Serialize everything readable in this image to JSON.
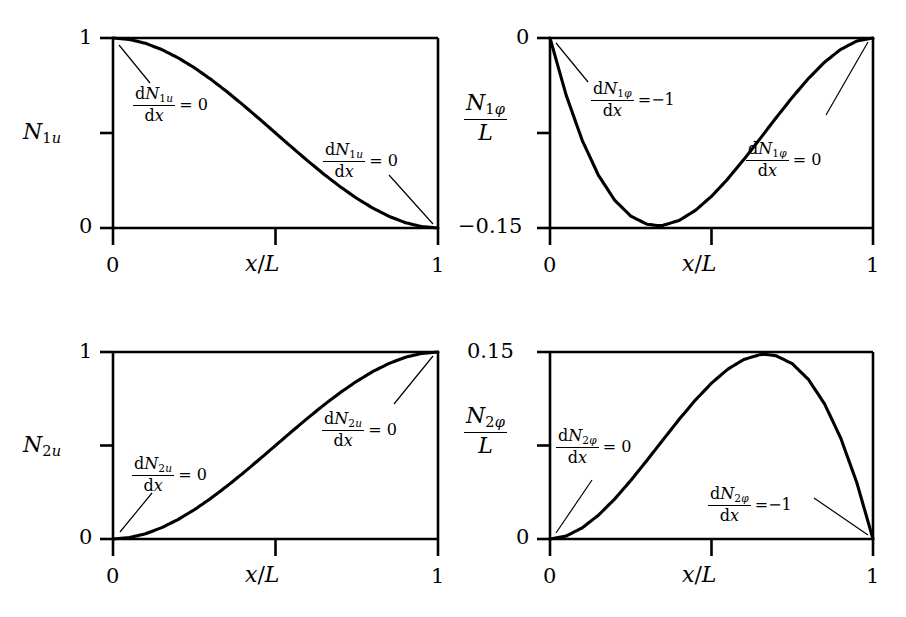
{
  "figure": {
    "background": "#ffffff",
    "ink": "#000000",
    "width": 906,
    "height": 617
  },
  "chart_data": [
    {
      "id": "N1u",
      "type": "line",
      "title": "",
      "ylabel": "N_1u",
      "xlabel": "x/L",
      "xlim": [
        0,
        1
      ],
      "ylim": [
        0,
        1
      ],
      "xticks": [
        0,
        0.5,
        1
      ],
      "xticklabels": [
        "0",
        "",
        "1"
      ],
      "yticks": [
        0,
        0.5,
        1
      ],
      "yticklabels": [
        "0",
        "",
        "1"
      ],
      "grid": false,
      "legend": false,
      "expression": "1 - 3t^2 + 2t^3",
      "x": [
        0,
        0.05,
        0.1,
        0.15,
        0.2,
        0.25,
        0.3,
        0.35,
        0.4,
        0.45,
        0.5,
        0.55,
        0.6,
        0.65,
        0.7,
        0.75,
        0.8,
        0.85,
        0.9,
        0.95,
        1
      ],
      "y": [
        1,
        0.9928,
        0.972,
        0.9393,
        0.896,
        0.8438,
        0.784,
        0.7183,
        0.648,
        0.5748,
        0.5,
        0.4253,
        0.352,
        0.2818,
        0.216,
        0.1563,
        0.104,
        0.0608,
        0.028,
        0.0073,
        0
      ],
      "annotations": [
        {
          "id": "left",
          "numerator": "dN_1u",
          "denominator": "dx",
          "equals": "= 0",
          "target_point": [
            0,
            1
          ]
        },
        {
          "id": "right",
          "numerator": "dN_1u",
          "denominator": "dx",
          "equals": "= 0",
          "target_point": [
            1,
            0
          ]
        }
      ]
    },
    {
      "id": "N1phi",
      "type": "line",
      "title": "",
      "ylabel": "N_1phi / L",
      "xlabel": "x/L",
      "xlim": [
        0,
        1
      ],
      "ylim": [
        -0.15,
        0
      ],
      "xticks": [
        0,
        0.5,
        1
      ],
      "xticklabels": [
        "0",
        "",
        "1"
      ],
      "yticks": [
        -0.15,
        -0.075,
        0
      ],
      "yticklabels": [
        "-0.15",
        "",
        "0"
      ],
      "grid": false,
      "legend": false,
      "expression": "-t(1-t)^2",
      "x": [
        0,
        0.05,
        0.1,
        0.15,
        0.2,
        0.25,
        0.3,
        0.3333,
        0.35,
        0.4,
        0.45,
        0.5,
        0.55,
        0.6,
        0.65,
        0.7,
        0.75,
        0.8,
        0.85,
        0.9,
        0.95,
        1
      ],
      "y": [
        0,
        -0.0451,
        -0.081,
        -0.1084,
        -0.128,
        -0.1406,
        -0.147,
        -0.1481,
        -0.1479,
        -0.144,
        -0.1361,
        -0.125,
        -0.1114,
        -0.096,
        -0.0796,
        -0.063,
        -0.0469,
        -0.032,
        -0.0191,
        -0.009,
        -0.0024,
        0
      ],
      "annotations": [
        {
          "id": "left",
          "numerator": "dN_1phi",
          "denominator": "dx",
          "equals": "= -1",
          "target_point": [
            0,
            0
          ]
        },
        {
          "id": "right",
          "numerator": "dN_1phi",
          "denominator": "dx",
          "equals": "= 0",
          "target_point": [
            1,
            0
          ]
        }
      ]
    },
    {
      "id": "N2u",
      "type": "line",
      "title": "",
      "ylabel": "N_2u",
      "xlabel": "x/L",
      "xlim": [
        0,
        1
      ],
      "ylim": [
        0,
        1
      ],
      "xticks": [
        0,
        0.5,
        1
      ],
      "xticklabels": [
        "0",
        "",
        "1"
      ],
      "yticks": [
        0,
        0.5,
        1
      ],
      "yticklabels": [
        "0",
        "",
        "1"
      ],
      "grid": false,
      "legend": false,
      "expression": "3t^2 - 2t^3",
      "x": [
        0,
        0.05,
        0.1,
        0.15,
        0.2,
        0.25,
        0.3,
        0.35,
        0.4,
        0.45,
        0.5,
        0.55,
        0.6,
        0.65,
        0.7,
        0.75,
        0.8,
        0.85,
        0.9,
        0.95,
        1
      ],
      "y": [
        0,
        0.0073,
        0.028,
        0.0608,
        0.104,
        0.1563,
        0.216,
        0.2818,
        0.352,
        0.4253,
        0.5,
        0.5748,
        0.648,
        0.7183,
        0.784,
        0.8438,
        0.896,
        0.9393,
        0.972,
        0.9928,
        1
      ],
      "annotations": [
        {
          "id": "left",
          "numerator": "dN_2u",
          "denominator": "dx",
          "equals": "= 0",
          "target_point": [
            0,
            0
          ]
        },
        {
          "id": "right",
          "numerator": "dN_2u",
          "denominator": "dx",
          "equals": "= 0",
          "target_point": [
            1,
            1
          ]
        }
      ]
    },
    {
      "id": "N2phi",
      "type": "line",
      "title": "",
      "ylabel": "N_2phi / L",
      "xlabel": "x/L",
      "xlim": [
        0,
        1
      ],
      "ylim": [
        0,
        0.15
      ],
      "xticks": [
        0,
        0.5,
        1
      ],
      "xticklabels": [
        "0",
        "",
        "1"
      ],
      "yticks": [
        0,
        0.075,
        0.15
      ],
      "yticklabels": [
        "0",
        "",
        "0.15"
      ],
      "grid": false,
      "legend": false,
      "expression": "t^2(1-t)",
      "x": [
        0,
        0.05,
        0.1,
        0.15,
        0.2,
        0.25,
        0.3,
        0.35,
        0.4,
        0.45,
        0.5,
        0.55,
        0.6,
        0.65,
        0.6667,
        0.7,
        0.75,
        0.8,
        0.85,
        0.9,
        0.95,
        1
      ],
      "y": [
        0,
        0.0024,
        0.009,
        0.0191,
        0.032,
        0.0469,
        0.063,
        0.0796,
        0.096,
        0.1114,
        0.125,
        0.1361,
        0.144,
        0.1479,
        0.1481,
        0.147,
        0.1406,
        0.128,
        0.1084,
        0.081,
        0.0451,
        0
      ],
      "annotations": [
        {
          "id": "left",
          "numerator": "dN_2phi",
          "denominator": "dx",
          "equals": "= 0",
          "target_point": [
            0,
            0
          ]
        },
        {
          "id": "right",
          "numerator": "dN_2phi",
          "denominator": "dx",
          "equals": "= -1",
          "target_point": [
            1,
            0
          ]
        }
      ]
    }
  ],
  "panels": {
    "topleft": {
      "ylabel_main": "N",
      "ylabel_sub_digit": "1",
      "ylabel_sub_letter": "u",
      "ytick_top": "1",
      "ytick_bottom": "0",
      "xlabel_x": "x",
      "xlabel_slash": "/",
      "xlabel_L": "L",
      "xtick_left": "0",
      "xtick_right": "1",
      "annot_left": {
        "d": "d",
        "N": "N",
        "sub_digit": "1",
        "sub_letter": "u",
        "dx_d": "d",
        "dx_x": "x",
        "equals": "= 0"
      },
      "annot_right": {
        "d": "d",
        "N": "N",
        "sub_digit": "1",
        "sub_letter": "u",
        "dx_d": "d",
        "dx_x": "x",
        "equals": "= 0"
      }
    },
    "topright": {
      "ylabel_main": "N",
      "ylabel_sub_digit": "1",
      "ylabel_sub_letter": "φ",
      "ylabel_denom": "L",
      "ytick_top": "0",
      "ytick_bottom": "−0.15",
      "xlabel_x": "x",
      "xlabel_slash": "/",
      "xlabel_L": "L",
      "xtick_left": "0",
      "xtick_right": "1",
      "annot_left": {
        "d": "d",
        "N": "N",
        "sub_digit": "1",
        "sub_letter": "φ",
        "dx_d": "d",
        "dx_x": "x",
        "equals": "=−1"
      },
      "annot_right": {
        "d": "d",
        "N": "N",
        "sub_digit": "1",
        "sub_letter": "φ",
        "dx_d": "d",
        "dx_x": "x",
        "equals": "= 0"
      }
    },
    "bottomleft": {
      "ylabel_main": "N",
      "ylabel_sub_digit": "2",
      "ylabel_sub_letter": "u",
      "ytick_top": "1",
      "ytick_bottom": "0",
      "xlabel_x": "x",
      "xlabel_slash": "/",
      "xlabel_L": "L",
      "xtick_left": "0",
      "xtick_right": "1",
      "annot_left": {
        "d": "d",
        "N": "N",
        "sub_digit": "2",
        "sub_letter": "u",
        "dx_d": "d",
        "dx_x": "x",
        "equals": "= 0"
      },
      "annot_right": {
        "d": "d",
        "N": "N",
        "sub_digit": "2",
        "sub_letter": "u",
        "dx_d": "d",
        "dx_x": "x",
        "equals": "= 0"
      }
    },
    "bottomright": {
      "ylabel_main": "N",
      "ylabel_sub_digit": "2",
      "ylabel_sub_letter": "φ",
      "ylabel_denom": "L",
      "ytick_top": "0.15",
      "ytick_bottom": "0",
      "xlabel_x": "x",
      "xlabel_slash": "/",
      "xlabel_L": "L",
      "xtick_left": "0",
      "xtick_right": "1",
      "annot_left": {
        "d": "d",
        "N": "N",
        "sub_digit": "2",
        "sub_letter": "φ",
        "dx_d": "d",
        "dx_x": "x",
        "equals": "= 0"
      },
      "annot_right": {
        "d": "d",
        "N": "N",
        "sub_digit": "2",
        "sub_letter": "φ",
        "dx_d": "d",
        "dx_x": "x",
        "equals": "=−1"
      }
    }
  }
}
